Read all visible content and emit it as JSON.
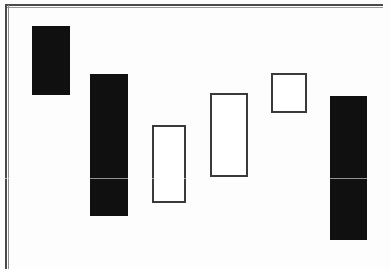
{
  "figure": {
    "kind": "candlestick-chart",
    "title": "",
    "width": 390,
    "height": 269,
    "background_color": "#ffffff",
    "frame": {
      "left_rule_color": "#4a4a4a",
      "top_rule_color": "#4a4a4a",
      "left_rule_x": 5,
      "top_rule_y": 4,
      "has_right_rule": false,
      "has_bottom_rule": false
    },
    "artifact": {
      "scan_seam_y": 178,
      "scan_seam_color": "#ffffff"
    }
  },
  "chart_data": {
    "type": "bar",
    "title": "",
    "subtitle": "",
    "xlabel": "",
    "ylabel": "",
    "grid": false,
    "legend": null,
    "axis_labels_visible": false,
    "tick_labels_visible": false,
    "categories": [
      "1",
      "2",
      "3",
      "4",
      "5",
      "6"
    ],
    "note": "Candlestick / OHLC real-body chart. Y values are read as inverted pixel positions: higher on the page = higher price. Filled (black) bodies denote down candles; hollow (white) bodies denote up candles.",
    "ylim": [
      0,
      269
    ],
    "xlim": [
      0,
      390
    ],
    "series": [
      {
        "name": "body_top",
        "values": [
          26,
          74,
          125,
          93,
          73,
          96
        ]
      },
      {
        "name": "body_bottom",
        "values": [
          95,
          216,
          203,
          177,
          113,
          240
        ]
      },
      {
        "name": "body_height",
        "values": [
          69,
          142,
          78,
          84,
          40,
          144
        ]
      }
    ],
    "candles": [
      {
        "index": 1,
        "fill": "filled",
        "direction": "down",
        "x": 32,
        "y": 26,
        "width": 38,
        "height": 69,
        "color": "#101010"
      },
      {
        "index": 2,
        "fill": "filled",
        "direction": "down",
        "x": 90,
        "y": 74,
        "width": 38,
        "height": 142,
        "color": "#101010"
      },
      {
        "index": 3,
        "fill": "hollow",
        "direction": "up",
        "x": 152,
        "y": 125,
        "width": 34,
        "height": 78,
        "color": "#3a3a3a"
      },
      {
        "index": 4,
        "fill": "hollow",
        "direction": "up",
        "x": 210,
        "y": 93,
        "width": 38,
        "height": 84,
        "color": "#3a3a3a"
      },
      {
        "index": 5,
        "fill": "hollow",
        "direction": "up",
        "x": 271,
        "y": 73,
        "width": 36,
        "height": 40,
        "color": "#3a3a3a"
      },
      {
        "index": 6,
        "fill": "filled",
        "direction": "down",
        "x": 330,
        "y": 96,
        "width": 37,
        "height": 144,
        "color": "#101010"
      }
    ],
    "values": [
      69,
      142,
      78,
      84,
      40,
      144
    ]
  }
}
